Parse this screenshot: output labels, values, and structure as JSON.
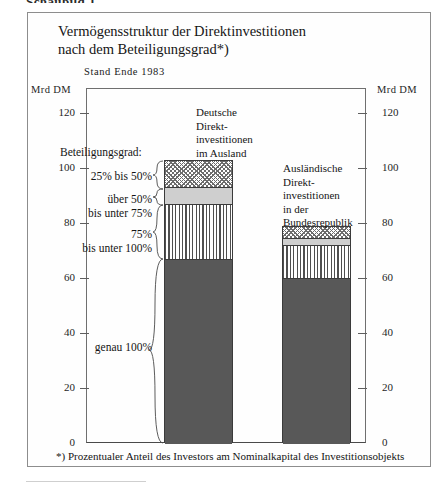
{
  "figure": {
    "caption": "Schaubild 1",
    "title": "Vermögensstruktur der Direktinvestitionen\nnach dem Beteiligungsgrad*)",
    "subtitle": "Stand  Ende  1983",
    "footnote": "*) Prozentualer Anteil des Investors am Nominalkapital des Investitionsobjekts"
  },
  "axes": {
    "unit_left": "Mrd DM",
    "unit_right": "Mrd DM",
    "ticks": [
      "120",
      "100",
      "80",
      "60",
      "40",
      "20",
      "0"
    ]
  },
  "legend": {
    "title": "Beteiligungsgrad:",
    "items": [
      {
        "label": "25% bis 50%",
        "pattern": "crosshatch"
      },
      {
        "label": "über 50%\nbis unter 75%",
        "pattern": "light-grey"
      },
      {
        "label": "75%\nbis unter 100%",
        "pattern": "vertical-stripes"
      },
      {
        "label": "genau 100%",
        "pattern": "solid-dark"
      }
    ]
  },
  "bars": {
    "left_heading": "Deutsche\nDirekt-\ninvestitionen\nim Ausland",
    "right_heading": "Ausländische\nDirekt-\ninvestitionen\nin der\nBundesrepublik"
  },
  "colors": {
    "solid_dark": "#585858",
    "light_grey": "#cfcfcf",
    "hatch_line": "#6c6c6c",
    "stripe_line": "#4f4f4f",
    "frame": "#8d8d8d",
    "axis": "#6f6f6f"
  },
  "chart_data": {
    "type": "bar",
    "title": "Vermögensstruktur der Direktinvestitionen nach dem Beteiligungsgrad",
    "subtitle": "Stand Ende 1983",
    "stacked": true,
    "xlabel": "",
    "ylabel": "Mrd DM",
    "ylim": [
      0,
      120
    ],
    "yticks": [
      0,
      20,
      40,
      60,
      80,
      100,
      120
    ],
    "grid": false,
    "legend_position": "left-outside",
    "categories": [
      "Deutsche Direktinvestitionen im Ausland",
      "Ausländische Direktinvestitionen in der Bundesrepublik"
    ],
    "series": [
      {
        "name": "genau 100%",
        "values": [
          67.0,
          60.0
        ]
      },
      {
        "name": "75% bis unter 100%",
        "values": [
          20.0,
          12.0
        ]
      },
      {
        "name": "über 50% bis unter 75%",
        "values": [
          6.0,
          2.5
        ]
      },
      {
        "name": "25% bis 50%",
        "values": [
          10.0,
          4.5
        ]
      }
    ],
    "totals": [
      103.0,
      79.0
    ],
    "annotations": [
      "*) Prozentualer Anteil des Investors am Nominalkapital des Investitionsobjekts"
    ]
  }
}
